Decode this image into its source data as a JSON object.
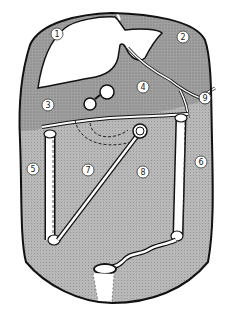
{
  "diagram": {
    "colors": {
      "upper_region_fill": "#9a9a9a",
      "lower_region_fill": "#b4b4b4",
      "organ_fill": "#ffffff",
      "outline": "#111111",
      "label_circle_fill": "#ffffff"
    },
    "labels": [
      {
        "id": "1",
        "text": "1",
        "x": 57,
        "y": 34
      },
      {
        "id": "2",
        "text": "2",
        "x": 183,
        "y": 37
      },
      {
        "id": "3",
        "text": "3",
        "x": 48,
        "y": 105
      },
      {
        "id": "4",
        "text": "4",
        "x": 143,
        "y": 87
      },
      {
        "id": "5",
        "text": "5",
        "x": 33,
        "y": 169
      },
      {
        "id": "6",
        "text": "6",
        "x": 201,
        "y": 162
      },
      {
        "id": "7",
        "text": "7",
        "x": 88,
        "y": 170
      },
      {
        "id": "8",
        "text": "8",
        "x": 143,
        "y": 172
      },
      {
        "id": "9",
        "text": "9",
        "x": 205,
        "y": 98
      }
    ]
  }
}
